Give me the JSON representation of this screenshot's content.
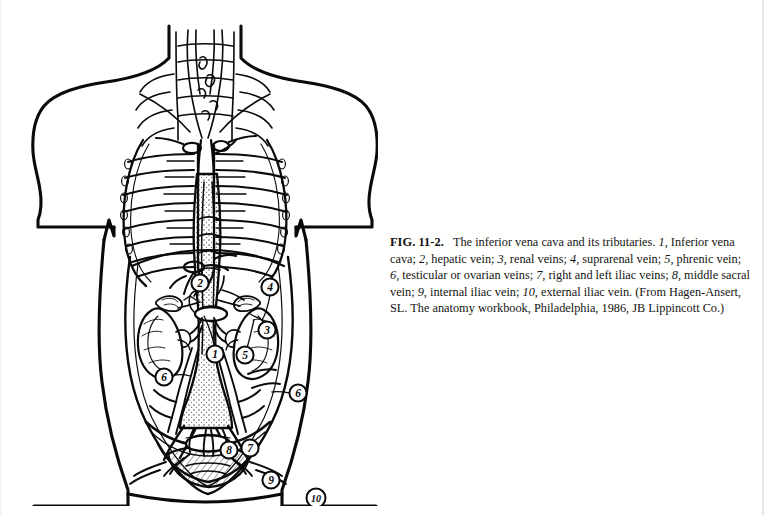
{
  "figure": {
    "label": "FIG. 11-2.",
    "title": "The inferior vena cava and its tributaries.",
    "legend_items": [
      {
        "num": "1",
        "text": "Inferior vena cava"
      },
      {
        "num": "2",
        "text": "hepatic vein"
      },
      {
        "num": "3",
        "text": "renal veins"
      },
      {
        "num": "4",
        "text": "suprarenal vein"
      },
      {
        "num": "5",
        "text": "phrenic vein"
      },
      {
        "num": "6",
        "text": "testicular or ovarian veins"
      },
      {
        "num": "7",
        "text": "right and left iliac veins"
      },
      {
        "num": "8",
        "text": "middle sacral vein"
      },
      {
        "num": "9",
        "text": "internal iliac vein"
      },
      {
        "num": "10",
        "text": "external iliac vein"
      }
    ],
    "source": "(From Hagen-Ansert, SL. The anatomy workbook, Philadelphia, 1986, JB Lippincott Co.)",
    "caption_full": "FIG. 11-2.   The inferior vena cava and its tributaries. 1, Inferior vena cava; 2, hepatic vein; 3, renal veins; 4, suprarenal vein; 5, phrenic vein; 6, testicular or ovarian veins; 7, right and left iliac veins; 8, middle sacral vein; 9, internal iliac vein; 10, external iliac vein. (From Hagen-Ansert, SL. The anatomy workbook, Philadelphia, 1986, JB Lippincott Co.)"
  },
  "callouts": [
    {
      "num": "1",
      "name": "inferior-vena-cava",
      "x": 197,
      "y": 340
    },
    {
      "num": "2",
      "name": "hepatic-vein",
      "x": 182,
      "y": 269
    },
    {
      "num": "3",
      "name": "renal-veins",
      "x": 249,
      "y": 316
    },
    {
      "num": "4",
      "name": "suprarenal-vein",
      "x": 252,
      "y": 273
    },
    {
      "num": "5",
      "name": "phrenic-vein",
      "x": 227,
      "y": 341
    },
    {
      "num": "6",
      "name": "testicular-ovarian-right",
      "x": 146,
      "y": 363
    },
    {
      "num": "6",
      "name": "testicular-ovarian-left",
      "x": 280,
      "y": 379
    },
    {
      "num": "7",
      "name": "iliac-veins",
      "x": 232,
      "y": 434
    },
    {
      "num": "8",
      "name": "middle-sacral-vein",
      "x": 211,
      "y": 436
    },
    {
      "num": "9",
      "name": "internal-iliac-vein",
      "x": 253,
      "y": 466
    },
    {
      "num": "10",
      "name": "external-iliac-vein",
      "x": 298,
      "y": 484
    }
  ],
  "colors": {
    "ink": "#0a0a0a",
    "paper": "#ffffff",
    "stipple": "#2a2a2a"
  }
}
